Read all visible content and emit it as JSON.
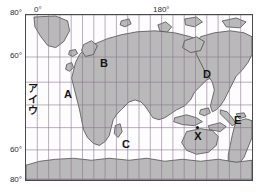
{
  "figure": {
    "kind": "world-map",
    "projection": "mercator",
    "title": ""
  },
  "axes": {
    "longitude_labels": [
      {
        "text": "0°",
        "x": 44
      },
      {
        "text": "180°",
        "x": 166
      }
    ],
    "latitude_labels": [
      {
        "text": "80°",
        "y": 12
      },
      {
        "text": "60°",
        "y": 55
      },
      {
        "text": "60°",
        "y": 149
      },
      {
        "text": "80°",
        "y": 179
      }
    ]
  },
  "grid": {
    "meridian_spacing_deg": 10,
    "parallel_latitudes_deg": [
      80,
      60,
      30,
      0,
      -30,
      -60,
      -80
    ],
    "grid_color": "#8a6f8f",
    "frame_color": "#4a4a4a"
  },
  "map_style": {
    "land_fill": "#b9b9b9",
    "land_stroke": "#3c3c3c",
    "ocean_fill": "#fdfdfd"
  },
  "region_labels": [
    {
      "id": "A",
      "text": "A",
      "x": 66,
      "y": 93,
      "refers_to": "africa"
    },
    {
      "id": "B",
      "text": "B",
      "x": 100,
      "y": 57,
      "refers_to": "eurasia-north"
    },
    {
      "id": "C",
      "text": "C",
      "x": 122,
      "y": 138,
      "refers_to": "ocean-south-of-australia"
    },
    {
      "id": "D",
      "text": "D",
      "x": 203,
      "y": 68,
      "refers_to": "north-america"
    },
    {
      "id": "E",
      "text": "E",
      "x": 233,
      "y": 114,
      "refers_to": "south-america"
    }
  ],
  "kana_labels": [
    {
      "text": "ア",
      "x": 28,
      "y": 85
    },
    {
      "text": "イ",
      "x": 28,
      "y": 96
    },
    {
      "text": "ウ",
      "x": 28,
      "y": 107
    }
  ],
  "point_marker": {
    "label": "X",
    "x": 197,
    "y": 128,
    "description": "marked point in the eastern Pacific Ocean"
  }
}
